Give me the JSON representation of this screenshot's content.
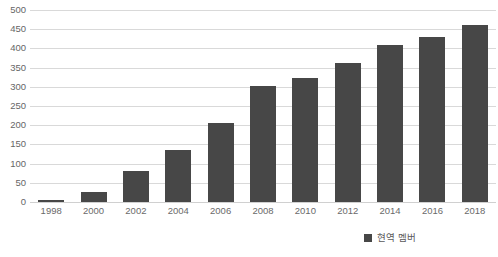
{
  "chart_data": {
    "type": "bar",
    "title": "",
    "subtitle": "",
    "xlabel": "",
    "ylabel": "",
    "categories": [
      "1998",
      "2000",
      "2002",
      "2004",
      "2006",
      "2008",
      "2010",
      "2012",
      "2014",
      "2016",
      "2018"
    ],
    "values": [
      5,
      27,
      80,
      135,
      205,
      302,
      322,
      363,
      408,
      430,
      462
    ],
    "series": [
      {
        "name": "현역 멤버",
        "values": [
          5,
          27,
          80,
          135,
          205,
          302,
          322,
          363,
          408,
          430,
          462
        ],
        "color": "#474747"
      }
    ],
    "ylim": [
      0,
      500
    ],
    "ytick_step": 50,
    "yticks": [
      "0",
      "50",
      "100",
      "150",
      "200",
      "250",
      "300",
      "350",
      "400",
      "450",
      "500"
    ],
    "grid": true,
    "grid_color": "#d9d9d9",
    "legend_position": "bottom-right",
    "legend": [
      {
        "label": "현역 멤버",
        "color": "#474747",
        "marker": "square-marker"
      }
    ]
  }
}
